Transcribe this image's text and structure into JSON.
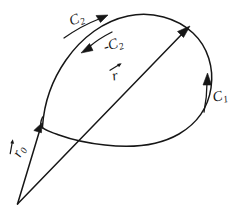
{
  "figure": {
    "background_color": "#ffffff",
    "ink_color": "#161616",
    "width": 247,
    "height": 220
  },
  "labels": {
    "c2": {
      "base": "C",
      "sub": "2",
      "name": "curve-c2"
    },
    "minus_c2": {
      "base": "-C",
      "sub": "2",
      "name": "curve-minus-c2"
    },
    "c1": {
      "base": "C",
      "sub": "1",
      "name": "curve-c1"
    },
    "r": {
      "base": "r",
      "sub": "",
      "name": "vector-r"
    },
    "r0": {
      "base": "r",
      "sub": "0",
      "name": "vector-r0"
    }
  },
  "elements": {
    "closed_contour": "closed-contour-outline",
    "vector_r": "position-vector-r",
    "vector_r0": "position-vector-r0",
    "origin": "common-origin-point",
    "arc_c2": "direction-arc-c2",
    "arc_minus_c2": "direction-arc-minus-c2",
    "arc_c1": "direction-arc-c1"
  }
}
